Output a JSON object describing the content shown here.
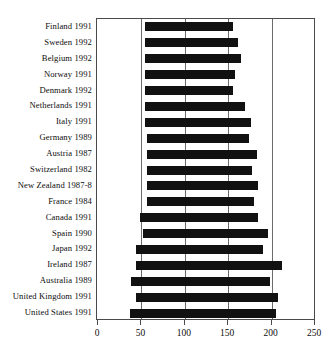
{
  "chart": {
    "title": "",
    "xlabel": "",
    "ylabel": ""
  },
  "chart_data": {
    "type": "bar",
    "orientation": "horizontal",
    "bar_style": "floating-range",
    "title": "",
    "xlabel": "",
    "ylabel": "",
    "xlim": [
      0,
      250
    ],
    "ylim_categories": 18,
    "grid": true,
    "grid_axis": "x",
    "legend": null,
    "xticks": [
      0,
      50,
      100,
      150,
      200,
      250
    ],
    "xticklabels": [
      "0",
      "50",
      "100",
      "150",
      "200",
      "250"
    ],
    "categories": [
      "Finland 1991",
      "Sweden 1992",
      "Belgium 1992",
      "Norway 1991",
      "Denmark 1992",
      "Netherlands 1991",
      "Italy 1991",
      "Germany 1989",
      "Austria 1987",
      "Switzerland 1982",
      "New Zealand 1987-8",
      "France 1984",
      "Canada 1991",
      "Spain 1990",
      "Japan 1992",
      "Ireland 1987",
      "Australia 1989",
      "United Kingdom 1991",
      "United States 1991"
    ],
    "bars": [
      {
        "category": "Finland 1991",
        "start": 54,
        "end": 155
      },
      {
        "category": "Sweden 1992",
        "start": 54,
        "end": 161
      },
      {
        "category": "Belgium 1992",
        "start": 54,
        "end": 165
      },
      {
        "category": "Norway 1991",
        "start": 54,
        "end": 158
      },
      {
        "category": "Denmark 1992",
        "start": 54,
        "end": 155
      },
      {
        "category": "Netherlands 1991",
        "start": 54,
        "end": 169
      },
      {
        "category": "Italy 1991",
        "start": 54,
        "end": 176
      },
      {
        "category": "Germany 1989",
        "start": 56,
        "end": 174
      },
      {
        "category": "Austria 1987",
        "start": 56,
        "end": 183
      },
      {
        "category": "Switzerland 1982",
        "start": 56,
        "end": 177
      },
      {
        "category": "New Zealand 1987-8",
        "start": 56,
        "end": 184
      },
      {
        "category": "France 1984",
        "start": 56,
        "end": 180
      },
      {
        "category": "Canada 1991",
        "start": 48,
        "end": 184
      },
      {
        "category": "Spain 1990",
        "start": 52,
        "end": 196
      },
      {
        "category": "Japan 1992",
        "start": 44,
        "end": 190
      },
      {
        "category": "Ireland 1987",
        "start": 44,
        "end": 212
      },
      {
        "category": "Australia 1989",
        "start": 38,
        "end": 198
      },
      {
        "category": "United Kingdom 1991",
        "start": 44,
        "end": 207
      },
      {
        "category": "United States 1991",
        "start": 37,
        "end": 205
      }
    ],
    "colors": {
      "bar": "#111111",
      "grid": "#6b6b6b",
      "frame": "#4a4a4a",
      "background": "#ffffff",
      "text": "#0d0d0d"
    }
  }
}
